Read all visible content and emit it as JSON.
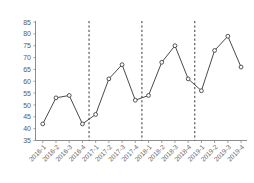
{
  "chart_data": {
    "type": "line",
    "title": "",
    "subtitle": "",
    "xlabel": "",
    "ylabel": "",
    "grid": false,
    "legend": "none",
    "ylim": [
      35,
      85
    ],
    "yticks": [
      35,
      40,
      45,
      50,
      55,
      60,
      65,
      70,
      75,
      80,
      85
    ],
    "categories": [
      "2016-1",
      "2016-2",
      "2016-3",
      "2016-4",
      "2017-1",
      "2017-2",
      "2017-3",
      "2017-4",
      "2018-1",
      "2018-2",
      "2018-3",
      "2018-4",
      "2019-1",
      "2019-2",
      "2019-3",
      "2019-4"
    ],
    "values": [
      42,
      53,
      54,
      42,
      46,
      61,
      67,
      52,
      54,
      68,
      75,
      61,
      56,
      73,
      79,
      66
    ],
    "series": [
      {
        "name": "series-1",
        "values": [
          42,
          53,
          54,
          42,
          46,
          61,
          67,
          52,
          54,
          68,
          75,
          61,
          56,
          73,
          79,
          66
        ],
        "line_color": "#4a4a4a",
        "marker": "open-circle",
        "marker_fill": "#ffffff",
        "marker_edge_color": "#3f3f3f"
      }
    ],
    "annotations": [
      {
        "type": "vertical-dashed-line",
        "after_category": "2016-4",
        "color": "#3a3a3a"
      },
      {
        "type": "vertical-dashed-line",
        "after_category": "2017-4",
        "color": "#3a3a3a"
      },
      {
        "type": "vertical-dashed-line",
        "after_category": "2018-4",
        "color": "#3a3a3a"
      }
    ]
  },
  "axes": {
    "y_tick_labels": [
      "85",
      "80",
      "75",
      "70",
      "65",
      "60",
      "55",
      "50",
      "45",
      "40",
      "35"
    ],
    "x_tick_labels": [
      "2016-1",
      "2016-2",
      "2016-3",
      "2016-4",
      "2017-1",
      "2017-2",
      "2017-3",
      "2017-4",
      "2018-1",
      "2018-2",
      "2018-3",
      "2018-4",
      "2019-1",
      "2019-2",
      "2019-3",
      "2019-4"
    ]
  }
}
